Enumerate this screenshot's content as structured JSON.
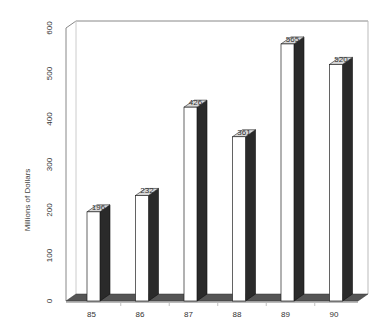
{
  "chart_data": {
    "type": "bar",
    "style": "3d-column",
    "title": "",
    "xlabel": "",
    "ylabel": "Millions of Dollars",
    "categories": [
      "85",
      "86",
      "87",
      "88",
      "89",
      "90"
    ],
    "values": [
      196,
      232,
      426,
      361,
      565,
      520
    ],
    "data_labels": [
      "196",
      "232",
      "426",
      "361",
      "565",
      "520"
    ],
    "ylim": [
      0,
      600
    ],
    "yticks": [
      0,
      100,
      200,
      300,
      400,
      500,
      600
    ],
    "ytick_labels": [
      "0",
      "100",
      "200",
      "300",
      "400",
      "500",
      "600"
    ],
    "grid": false,
    "legend": null
  },
  "colors": {
    "bar_front": "#ffffff",
    "bar_side": "#2a2a2a",
    "bar_top": "#d8d8d8",
    "floor": "#555555",
    "wall_line": "#888888",
    "text": "#333333"
  },
  "layout": {
    "x_axis_left": 66,
    "y_zero_px": 301,
    "px_per_unit": 0.455,
    "bar_first_x": 87,
    "bar_spacing": 48.5,
    "bar_front_width": 13,
    "bar_depth_x": 10,
    "bar_depth_y": 7
  }
}
